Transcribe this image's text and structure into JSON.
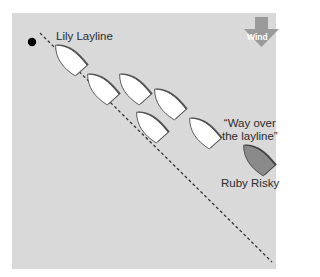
{
  "diagram": {
    "labels": {
      "lily": "Lily Layline",
      "way_over_line1": "“Way over",
      "way_over_line2": "the layline”",
      "ruby": "Ruby Risky",
      "wind": "Wind"
    },
    "colors": {
      "background": "#d9d9d9",
      "boat_fill": "#ffffff",
      "boat_shadow": "#555555",
      "risky_boat_fill": "#8a8a8a",
      "wind_arrow": "#9a9a9a",
      "mark": "#000000",
      "layline": "#333333"
    },
    "mark": {
      "x": 32,
      "y": 42
    },
    "layline": {
      "x1": 40,
      "y1": 33,
      "x2": 272,
      "y2": 262
    },
    "boats": [
      {
        "name": "lily-boat",
        "cx": 69,
        "cy": 60,
        "color": "white"
      },
      {
        "name": "boat-2",
        "cx": 101,
        "cy": 89,
        "color": "white"
      },
      {
        "name": "boat-3",
        "cx": 133,
        "cy": 89,
        "color": "white"
      },
      {
        "name": "boat-4",
        "cx": 168,
        "cy": 104,
        "color": "white"
      },
      {
        "name": "boat-5",
        "cx": 150,
        "cy": 127,
        "color": "white"
      },
      {
        "name": "boat-6",
        "cx": 203,
        "cy": 133,
        "color": "white"
      },
      {
        "name": "ruby-boat",
        "cx": 257,
        "cy": 160,
        "color": "gray"
      }
    ]
  }
}
